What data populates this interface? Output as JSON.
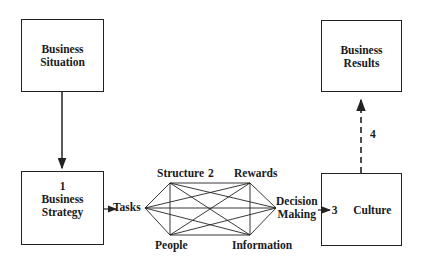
{
  "diagram": {
    "boxes": {
      "situation": {
        "line1": "Business",
        "line2": "Situation"
      },
      "strategy": {
        "number": "1",
        "line1": "Business",
        "line2": "Strategy"
      },
      "results": {
        "line1": "Business",
        "line2": "Results"
      },
      "culture": {
        "number": "3",
        "label": "Culture"
      }
    },
    "nodes": {
      "tasks": "Tasks",
      "structure": "Structure",
      "rewards": "Rewards",
      "people": "People",
      "information": "Information",
      "decision_line1": "Decision",
      "decision_line2": "Making"
    },
    "step_numbers": {
      "two": "2",
      "four": "4"
    },
    "colors": {
      "line": "#222222",
      "background": "#ffffff"
    }
  }
}
